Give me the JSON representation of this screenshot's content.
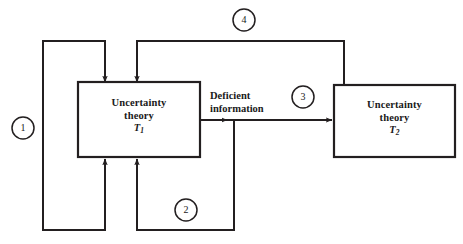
{
  "figure": {
    "type": "block-flow-diagram",
    "background_color": "#ffffff",
    "stroke_color": "#231f20",
    "width": 463,
    "height": 244
  },
  "boxes": [
    {
      "id": "box-t1",
      "name": "uncertainty-theory-t1-box",
      "line1": "Uncertainty",
      "line2": "theory",
      "symbol": "T",
      "subscript": "1"
    },
    {
      "id": "box-t2",
      "name": "uncertainty-theory-t2-box",
      "line1": "Uncertainty",
      "line2": "theory",
      "symbol": "T",
      "subscript": "2"
    }
  ],
  "edge_labels": [
    {
      "id": "deficient-information",
      "line1": "Deficient",
      "line2": "information"
    }
  ],
  "markers": [
    {
      "id": "marker-1",
      "label": "1"
    },
    {
      "id": "marker-2",
      "label": "2"
    },
    {
      "id": "marker-3",
      "label": "3"
    },
    {
      "id": "marker-4",
      "label": "4"
    }
  ]
}
